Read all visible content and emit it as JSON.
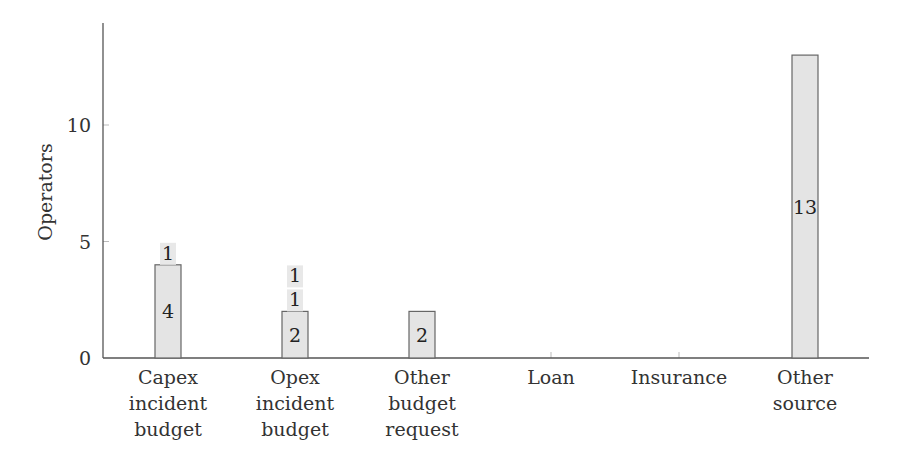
{
  "chart_data": {
    "type": "bar",
    "stacked": true,
    "title": "",
    "xlabel": "",
    "ylabel": "Operators",
    "ylim": [
      0,
      14.3
    ],
    "yticks": [
      0,
      5,
      10
    ],
    "grid": false,
    "legend": null,
    "categories": [
      [
        "Capex",
        "incident",
        "budget"
      ],
      [
        "Opex",
        "incident",
        "budget"
      ],
      [
        "Other",
        "budget",
        "request"
      ],
      [
        "Loan"
      ],
      [
        "Insurance"
      ],
      [
        "Other",
        "source"
      ]
    ],
    "category_names": [
      "Capex incident budget",
      "Opex incident budget",
      "Other budget request",
      "Loan",
      "Insurance",
      "Other source"
    ],
    "values": [
      4,
      2,
      2,
      0,
      0,
      13
    ],
    "extra_labels": [
      [
        "1"
      ],
      [
        "1",
        "1"
      ],
      [],
      [],
      [],
      []
    ],
    "colors": {
      "bar_fill": "#e4e4e4",
      "bar_stroke": "#666666",
      "label_bg": "#e8e8e8",
      "axis": "#555555"
    }
  }
}
